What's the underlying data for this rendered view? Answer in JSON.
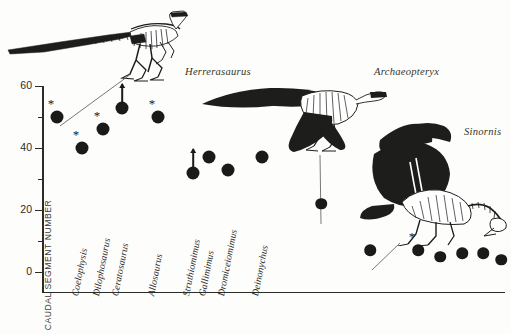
{
  "figure": {
    "domain_label": "caudal-segment-scatter",
    "background": "#fdfdfb",
    "ink": "#1a1a18"
  },
  "chart_data": {
    "type": "scatter",
    "title": "",
    "xlabel": "",
    "ylabel": "CAUDAL SEGMENT NUMBER",
    "ylim": [
      0,
      60
    ],
    "yticks": [
      0,
      20,
      40,
      60
    ],
    "yminor": [
      10,
      30,
      50
    ],
    "grid": false,
    "legend": "none",
    "categories": [
      "Coelophysis",
      "Dilophosaurus",
      "Ceratosaurus",
      "Allosaurus",
      "Struthiomimus",
      "Gallimimus",
      "Dromiceiomimus",
      "Deinonychus"
    ],
    "points": [
      {
        "name": "Herrerasaurus",
        "value": 50,
        "x_px": 57,
        "marker": "asterisk",
        "labeled_axis": false
      },
      {
        "name": "Coelophysis",
        "value": 40,
        "x_px": 82,
        "marker": "asterisk",
        "labeled_axis": true
      },
      {
        "name": "Dilophosaurus",
        "value": 46,
        "x_px": 103,
        "marker": "asterisk",
        "labeled_axis": true
      },
      {
        "name": "Ceratosaurus",
        "value": 53,
        "x_px": 122,
        "marker": "arrow-up",
        "labeled_axis": true
      },
      {
        "name": "Allosaurus",
        "value": 50,
        "x_px": 158,
        "marker": "asterisk",
        "labeled_axis": true
      },
      {
        "name": "Struthiomimus",
        "value": 32,
        "x_px": 193,
        "marker": "arrow-up",
        "labeled_axis": true
      },
      {
        "name": "Gallimimus",
        "value": 37,
        "x_px": 209,
        "marker": "none",
        "labeled_axis": true
      },
      {
        "name": "Dromiceiomimus",
        "value": 33,
        "x_px": 228,
        "marker": "none",
        "labeled_axis": true
      },
      {
        "name": "Deinonychus",
        "value": 37,
        "x_px": 262,
        "marker": "none",
        "labeled_axis": true
      },
      {
        "name": "Archaeopteryx",
        "value": 22,
        "x_px": 321,
        "marker": "none",
        "labeled_axis": false
      },
      {
        "name": "Sinornis",
        "value": 7,
        "x_px": 370,
        "marker": "none",
        "labeled_axis": false
      },
      {
        "name": "bird-1",
        "value": 7,
        "x_px": 418,
        "marker": "asterisk",
        "labeled_axis": false
      },
      {
        "name": "bird-2",
        "value": 5,
        "x_px": 440,
        "marker": "none",
        "labeled_axis": false
      },
      {
        "name": "bird-3",
        "value": 6,
        "x_px": 462,
        "marker": "none",
        "labeled_axis": false
      },
      {
        "name": "bird-4",
        "value": 6,
        "x_px": 483,
        "marker": "none",
        "labeled_axis": false
      },
      {
        "name": "bird-5",
        "value": 4,
        "x_px": 501,
        "marker": "none",
        "labeled_axis": false
      }
    ]
  },
  "callouts": [
    {
      "name": "Herrerasaurus",
      "x": 185,
      "y": 66
    },
    {
      "name": "Archaeopteryx",
      "x": 374,
      "y": 66
    },
    {
      "name": "Sinornis",
      "x": 464,
      "y": 126
    }
  ],
  "illustrations": [
    {
      "name": "herrerasaurus-skeleton"
    },
    {
      "name": "archaeopteryx-skeleton"
    },
    {
      "name": "sinornis-skeleton"
    }
  ]
}
